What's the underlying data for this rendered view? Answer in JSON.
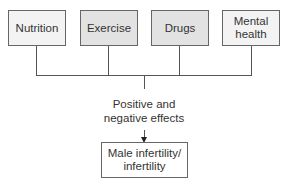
{
  "diagram": {
    "factors": [
      {
        "label": "Nutrition"
      },
      {
        "label": "Exercise"
      },
      {
        "label": "Drugs"
      },
      {
        "label": "Mental health"
      }
    ],
    "connector_label": "Positive and negative effects",
    "connector_label_lines": [
      "Positive and",
      "negative effects"
    ],
    "outcome": {
      "label": "Male infertility/ infertility",
      "lines": [
        "Male infertility/",
        "infertility"
      ]
    }
  }
}
